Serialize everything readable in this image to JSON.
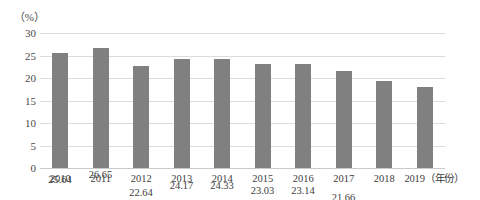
{
  "chart_data": {
    "type": "bar",
    "title": "",
    "xlabel": "（年份）",
    "ylabel": "（%）",
    "categories": [
      "2010",
      "2011",
      "2012",
      "2013",
      "2014",
      "2015",
      "2016",
      "2017",
      "2018",
      "2019"
    ],
    "values": [
      25.64,
      26.65,
      22.64,
      24.17,
      24.33,
      23.03,
      23.14,
      21.66,
      19.28,
      18.09
    ],
    "value_labels": [
      "25.64",
      "26.65",
      "22.64",
      "24.17",
      "24.33",
      "23.03",
      "23.14",
      "21.66",
      "19.28",
      "18.09"
    ],
    "ylim": [
      0,
      30
    ],
    "ytick_labels": [
      "0",
      "5",
      "10",
      "15",
      "20",
      "25",
      "30"
    ],
    "ytick_values": [
      0,
      5,
      10,
      15,
      20,
      25,
      30
    ],
    "grid": true,
    "legend": "none",
    "bar_color": "#808080",
    "grid_color": "#dcdcdc",
    "background_color": "#ffffff",
    "axis_unit_caption": "（%）",
    "x_axis_unit_caption": "（年份）",
    "xtick_labels_full": [
      "2010",
      "2011",
      "2012",
      "2013",
      "2014",
      "2015",
      "2016",
      "2017",
      "2018",
      "2019（年份）"
    ]
  }
}
